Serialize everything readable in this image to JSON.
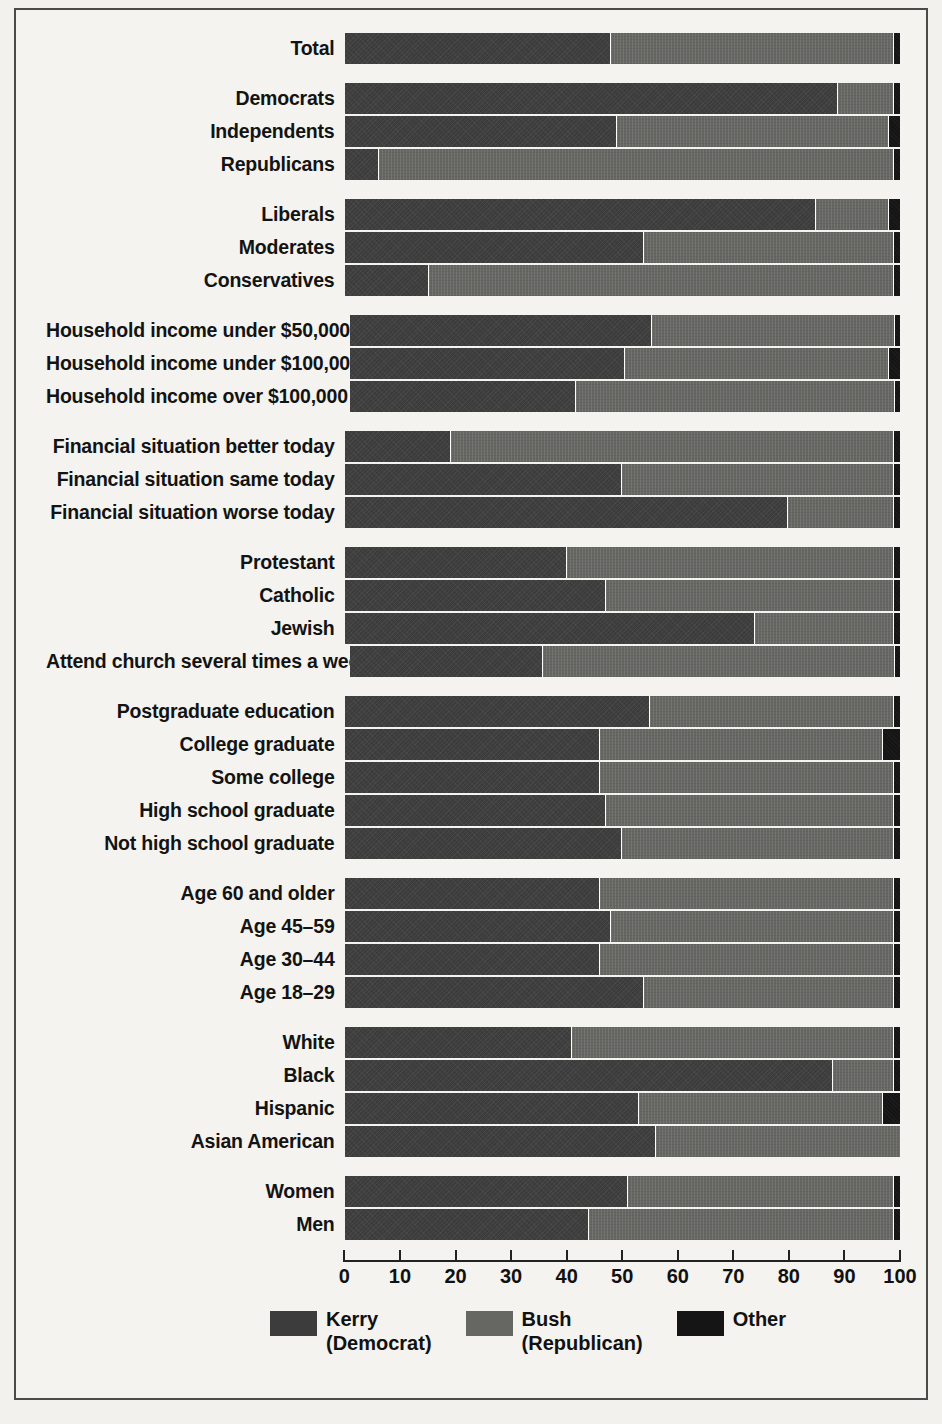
{
  "chart_data": {
    "type": "bar",
    "orientation": "horizontal",
    "stacked": true,
    "title": "",
    "xlabel": "",
    "ylabel": "",
    "xlim": [
      0,
      100
    ],
    "xticks": [
      0,
      10,
      20,
      30,
      40,
      50,
      60,
      70,
      80,
      90,
      100
    ],
    "xticklabels": [
      "0",
      "10",
      "20",
      "30",
      "40",
      "50",
      "60",
      "70",
      "80",
      "90",
      "100"
    ],
    "grid": false,
    "legend_position": "bottom",
    "series": [
      {
        "name": "Kerry (Democrat)",
        "color": "#3c3c3c",
        "values": [
          48,
          89,
          49,
          6,
          85,
          54,
          15,
          55,
          50,
          41,
          19,
          50,
          80,
          40,
          47,
          74,
          35,
          55,
          46,
          46,
          47,
          50,
          46,
          48,
          46,
          54,
          41,
          88,
          53,
          56,
          51,
          44
        ]
      },
      {
        "name": "Bush (Republican)",
        "color": "#666663",
        "values": [
          51,
          10,
          49,
          93,
          13,
          45,
          84,
          44,
          48,
          58,
          80,
          49,
          19,
          59,
          52,
          25,
          64,
          44,
          51,
          53,
          52,
          49,
          53,
          51,
          53,
          45,
          58,
          11,
          44,
          44,
          48,
          55
        ]
      },
      {
        "name": "Other",
        "color": "#151515",
        "values": [
          1,
          1,
          2,
          1,
          2,
          1,
          1,
          1,
          2,
          1,
          1,
          1,
          1,
          1,
          1,
          1,
          1,
          1,
          3,
          1,
          1,
          1,
          1,
          1,
          1,
          1,
          1,
          1,
          3,
          0,
          1,
          1
        ]
      }
    ],
    "categories": [
      "Total",
      "Democrats",
      "Independents",
      "Republicans",
      "Liberals",
      "Moderates",
      "Conservatives",
      "Household income under $50,000",
      "Household income under $100,000",
      "Household income over $100,000",
      "Financial situation better today",
      "Financial situation same today",
      "Financial situation worse today",
      "Protestant",
      "Catholic",
      "Jewish",
      "Attend church several times a week",
      "Postgraduate education",
      "College graduate",
      "Some college",
      "High school graduate",
      "Not high school graduate",
      "Age 60 and older",
      "Age 45–59",
      "Age 30–44",
      "Age 18–29",
      "White",
      "Black",
      "Hispanic",
      "Asian American",
      "Women",
      "Men"
    ]
  },
  "legend": {
    "items": [
      {
        "swatch": "sw-kerry",
        "line1": "Kerry",
        "line2": "(Democrat)"
      },
      {
        "swatch": "sw-bush",
        "line1": "Bush",
        "line2": "(Republican)"
      },
      {
        "swatch": "sw-other",
        "line1": "Other",
        "line2": ""
      }
    ]
  },
  "groups": [
    {
      "name": "total",
      "rows": [
        {
          "label": "Total",
          "kerry": 48,
          "bush": 51,
          "other": 1
        }
      ]
    },
    {
      "name": "party",
      "rows": [
        {
          "label": "Democrats",
          "kerry": 89,
          "bush": 10,
          "other": 1
        },
        {
          "label": "Independents",
          "kerry": 49,
          "bush": 49,
          "other": 2
        },
        {
          "label": "Republicans",
          "kerry": 6,
          "bush": 93,
          "other": 1
        }
      ]
    },
    {
      "name": "ideology",
      "rows": [
        {
          "label": "Liberals",
          "kerry": 85,
          "bush": 13,
          "other": 2
        },
        {
          "label": "Moderates",
          "kerry": 54,
          "bush": 45,
          "other": 1
        },
        {
          "label": "Conservatives",
          "kerry": 15,
          "bush": 84,
          "other": 1
        }
      ]
    },
    {
      "name": "income",
      "rows": [
        {
          "label": "Household income under $50,000",
          "kerry": 55,
          "bush": 44,
          "other": 1
        },
        {
          "label": "Household income under $100,000",
          "kerry": 50,
          "bush": 48,
          "other": 2
        },
        {
          "label": "Household income over $100,000",
          "kerry": 41,
          "bush": 58,
          "other": 1
        }
      ]
    },
    {
      "name": "finances",
      "rows": [
        {
          "label": "Financial situation better today",
          "kerry": 19,
          "bush": 80,
          "other": 1
        },
        {
          "label": "Financial situation same today",
          "kerry": 50,
          "bush": 49,
          "other": 1
        },
        {
          "label": "Financial situation worse today",
          "kerry": 80,
          "bush": 19,
          "other": 1
        }
      ]
    },
    {
      "name": "religion",
      "rows": [
        {
          "label": "Protestant",
          "kerry": 40,
          "bush": 59,
          "other": 1
        },
        {
          "label": "Catholic",
          "kerry": 47,
          "bush": 52,
          "other": 1
        },
        {
          "label": "Jewish",
          "kerry": 74,
          "bush": 25,
          "other": 1
        },
        {
          "label": "Attend church several times a week",
          "kerry": 35,
          "bush": 64,
          "other": 1
        }
      ]
    },
    {
      "name": "education",
      "rows": [
        {
          "label": "Postgraduate education",
          "kerry": 55,
          "bush": 44,
          "other": 1
        },
        {
          "label": "College graduate",
          "kerry": 46,
          "bush": 51,
          "other": 3
        },
        {
          "label": "Some college",
          "kerry": 46,
          "bush": 53,
          "other": 1
        },
        {
          "label": "High school graduate",
          "kerry": 47,
          "bush": 52,
          "other": 1
        },
        {
          "label": "Not high school graduate",
          "kerry": 50,
          "bush": 49,
          "other": 1
        }
      ]
    },
    {
      "name": "age",
      "rows": [
        {
          "label": "Age 60 and older",
          "kerry": 46,
          "bush": 53,
          "other": 1
        },
        {
          "label": "Age 45–59",
          "kerry": 48,
          "bush": 51,
          "other": 1
        },
        {
          "label": "Age 30–44",
          "kerry": 46,
          "bush": 53,
          "other": 1
        },
        {
          "label": "Age 18–29",
          "kerry": 54,
          "bush": 45,
          "other": 1
        }
      ]
    },
    {
      "name": "race",
      "rows": [
        {
          "label": "White",
          "kerry": 41,
          "bush": 58,
          "other": 1
        },
        {
          "label": "Black",
          "kerry": 88,
          "bush": 11,
          "other": 1
        },
        {
          "label": "Hispanic",
          "kerry": 53,
          "bush": 44,
          "other": 3
        },
        {
          "label": "Asian American",
          "kerry": 56,
          "bush": 44,
          "other": 0
        }
      ]
    },
    {
      "name": "gender",
      "rows": [
        {
          "label": "Women",
          "kerry": 51,
          "bush": 48,
          "other": 1
        },
        {
          "label": "Men",
          "kerry": 44,
          "bush": 55,
          "other": 1
        }
      ]
    }
  ]
}
